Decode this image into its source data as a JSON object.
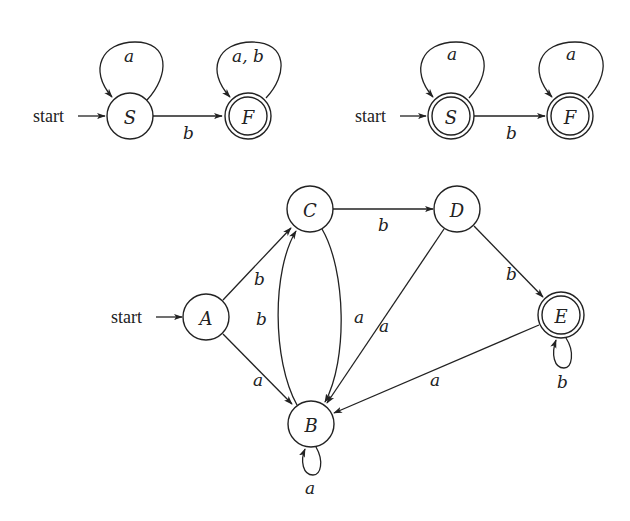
{
  "diagrams": {
    "dfa1": {
      "start_label": "start",
      "states": [
        {
          "id": "S",
          "label": "S",
          "accepting": false,
          "start": true
        },
        {
          "id": "F",
          "label": "F",
          "accepting": true,
          "start": false
        }
      ],
      "transitions": [
        {
          "from": "S",
          "to": "S",
          "label": "a"
        },
        {
          "from": "S",
          "to": "F",
          "label": "b"
        },
        {
          "from": "F",
          "to": "F",
          "label": "a, b"
        }
      ]
    },
    "dfa2": {
      "start_label": "start",
      "states": [
        {
          "id": "S",
          "label": "S",
          "accepting": true,
          "start": true
        },
        {
          "id": "F",
          "label": "F",
          "accepting": true,
          "start": false
        }
      ],
      "transitions": [
        {
          "from": "S",
          "to": "S",
          "label": "a"
        },
        {
          "from": "S",
          "to": "F",
          "label": "b"
        },
        {
          "from": "F",
          "to": "F",
          "label": "a"
        }
      ]
    },
    "dfa3": {
      "start_label": "start",
      "states": [
        {
          "id": "A",
          "label": "A",
          "accepting": false,
          "start": true
        },
        {
          "id": "B",
          "label": "B",
          "accepting": false,
          "start": false
        },
        {
          "id": "C",
          "label": "C",
          "accepting": false,
          "start": false
        },
        {
          "id": "D",
          "label": "D",
          "accepting": false,
          "start": false
        },
        {
          "id": "E",
          "label": "E",
          "accepting": true,
          "start": false
        }
      ],
      "transitions": [
        {
          "from": "A",
          "to": "C",
          "label": "b"
        },
        {
          "from": "A",
          "to": "B",
          "label": "a"
        },
        {
          "from": "B",
          "to": "C",
          "label": "b"
        },
        {
          "from": "B",
          "to": "B",
          "label": "a"
        },
        {
          "from": "C",
          "to": "B",
          "label": "a"
        },
        {
          "from": "C",
          "to": "D",
          "label": "b"
        },
        {
          "from": "D",
          "to": "B",
          "label": "a"
        },
        {
          "from": "D",
          "to": "E",
          "label": "b"
        },
        {
          "from": "E",
          "to": "B",
          "label": "a"
        },
        {
          "from": "E",
          "to": "E",
          "label": "b"
        }
      ]
    }
  }
}
